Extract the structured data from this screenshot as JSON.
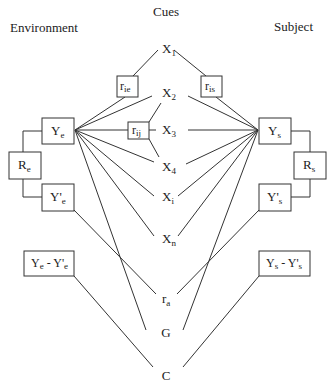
{
  "diagram": {
    "title": "Cues",
    "left_heading": "Environment",
    "right_heading": "Subject",
    "cues": [
      {
        "base": "X",
        "sub": "1"
      },
      {
        "base": "X",
        "sub": "2"
      },
      {
        "base": "X",
        "sub": "3"
      },
      {
        "base": "X",
        "sub": "4"
      },
      {
        "base": "X",
        "sub": "i"
      },
      {
        "base": "X",
        "sub": "n"
      }
    ],
    "center_nodes": {
      "ra": {
        "base": "r",
        "sub": "a"
      },
      "G": {
        "base": "G",
        "sub": ""
      },
      "C": {
        "base": "C",
        "sub": ""
      }
    },
    "correlation_boxes": {
      "r_ie": {
        "base": "r",
        "sub": "ie"
      },
      "r_is": {
        "base": "r",
        "sub": "is"
      },
      "r_ij": {
        "base": "r",
        "sub": "ij"
      }
    },
    "environment_boxes": {
      "Ye": {
        "base": "Y",
        "sub": "e"
      },
      "Re": {
        "base": "R",
        "sub": "e"
      },
      "Ype": {
        "base": "Y'",
        "sub": "e"
      },
      "diff": {
        "a": "Y",
        "a_sub": "e",
        "sep": " - ",
        "b": "Y'",
        "b_sub": "e"
      }
    },
    "subject_boxes": {
      "Ys": {
        "base": "Y",
        "sub": "s"
      },
      "Rs": {
        "base": "R",
        "sub": "s"
      },
      "Yps": {
        "base": "Y'",
        "sub": "s"
      },
      "diff": {
        "a": "Y",
        "a_sub": "s",
        "sep": " - ",
        "b": "Y'",
        "b_sub": "s"
      }
    }
  }
}
